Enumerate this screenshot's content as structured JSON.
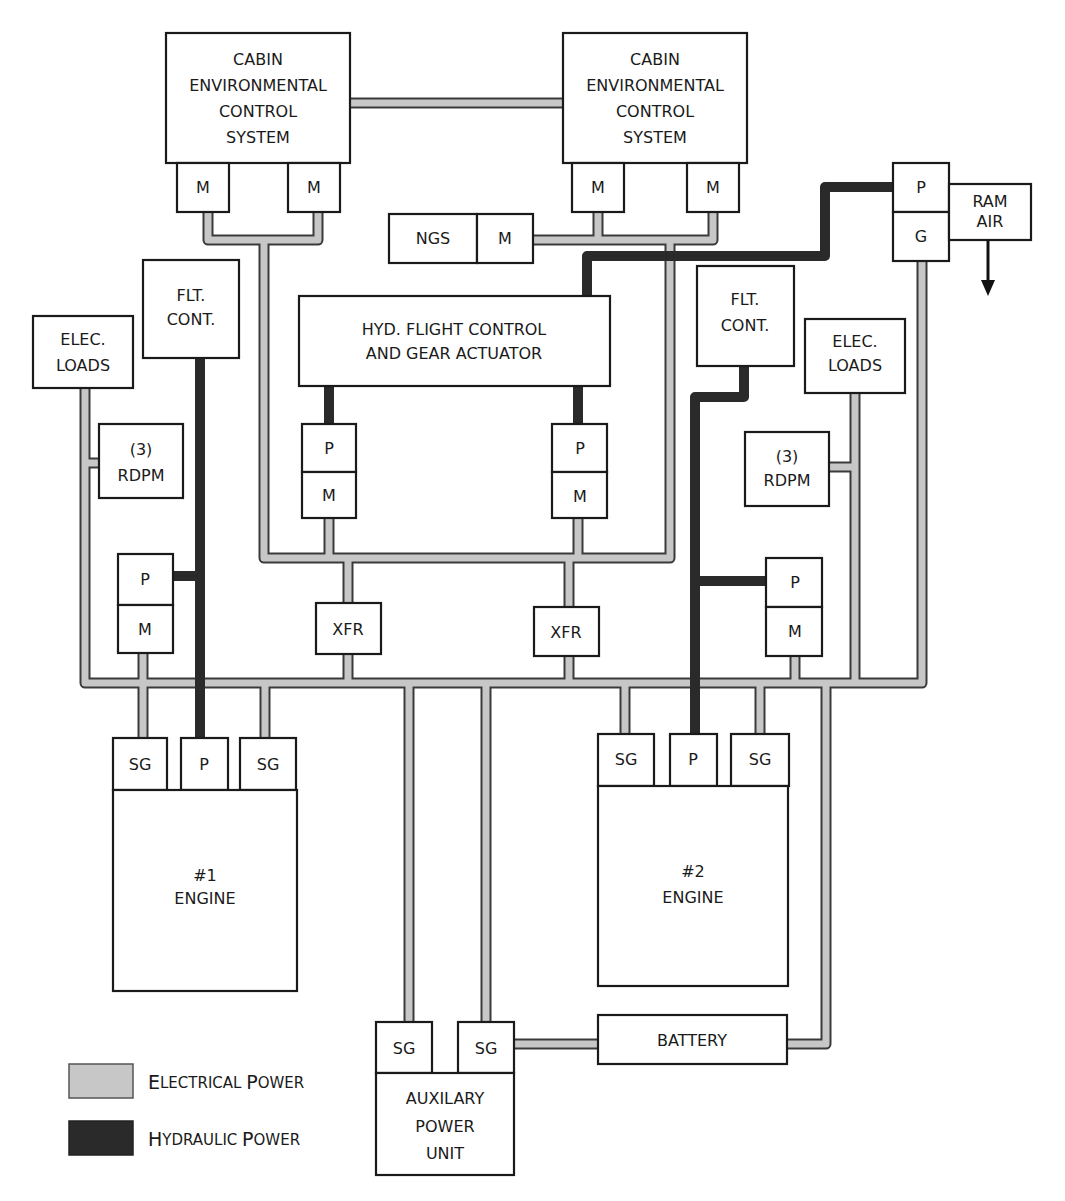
{
  "diagram": {
    "type": "aircraft-power-distribution",
    "colors": {
      "electrical": "#c7c7c7",
      "hydraulic": "#2a2a2a",
      "box_stroke": "#1a1a1a"
    },
    "nodes": {
      "cecs_left": [
        "CABIN",
        "ENVIRONMENTAL",
        "CONTROL",
        "SYSTEM"
      ],
      "cecs_right": [
        "CABIN",
        "ENVIRONMENTAL",
        "CONTROL",
        "SYSTEM"
      ],
      "motor": "M",
      "pump": "P",
      "generator": "G",
      "starter_generator": "SG",
      "ngs": "NGS",
      "ram_air": [
        "RAM",
        "AIR"
      ],
      "flt_cont": [
        "FLT.",
        "CONT."
      ],
      "elec_loads": [
        "ELEC.",
        "LOADS"
      ],
      "rdpm": [
        "(3)",
        "RDPM"
      ],
      "hyd_actuator": [
        "HYD. FLIGHT CONTROL",
        "AND GEAR ACTUATOR"
      ],
      "xfr": "XFR",
      "engine1": [
        "#1",
        "ENGINE"
      ],
      "engine2": [
        "#2",
        "ENGINE"
      ],
      "battery": "BATTERY",
      "apu": [
        "AUXILARY",
        "POWER",
        "UNIT"
      ]
    },
    "legend": [
      {
        "cap": "E",
        "rest": "LECTRICAL ",
        "cap2": "P",
        "rest2": "OWER",
        "label": "Electrical Power",
        "color": "#c7c7c7"
      },
      {
        "cap": "H",
        "rest": "YDRAULIC ",
        "cap2": "P",
        "rest2": "OWER",
        "label": "Hydraulic Power",
        "color": "#2a2a2a"
      }
    ]
  }
}
